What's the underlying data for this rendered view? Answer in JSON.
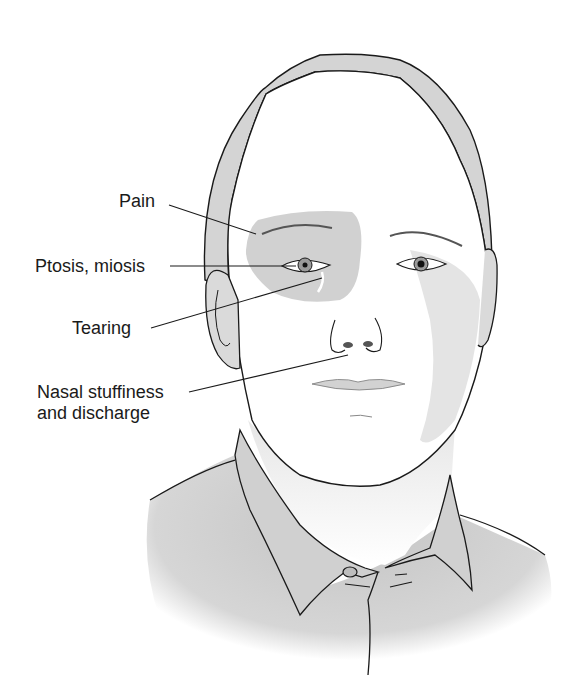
{
  "figure": {
    "labels": [
      {
        "id": "pain",
        "text": "Pain"
      },
      {
        "id": "ptosis",
        "text": "Ptosis, miosis"
      },
      {
        "id": "tearing",
        "text": "Tearing"
      },
      {
        "id": "nasal_line1",
        "text": "Nasal stuffiness"
      },
      {
        "id": "nasal_line2",
        "text": "and discharge"
      }
    ],
    "colors": {
      "line": "#1a1a1a",
      "pain_region": "#c9c9c9",
      "hair": "#d4d4d4",
      "shirt": "#cfcfcf",
      "skin": "#ffffff"
    }
  }
}
